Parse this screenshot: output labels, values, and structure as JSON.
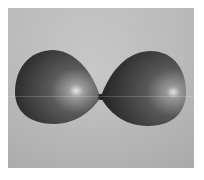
{
  "image": {
    "subject": "two balloons touching",
    "style": "grayscale photograph",
    "colors": {
      "border": "#ffffff",
      "background": "#bdbdbd",
      "balloon_dark": "#2e2e2e",
      "balloon_mid": "#5a5a5a",
      "highlight": "#e8e8e8"
    }
  }
}
